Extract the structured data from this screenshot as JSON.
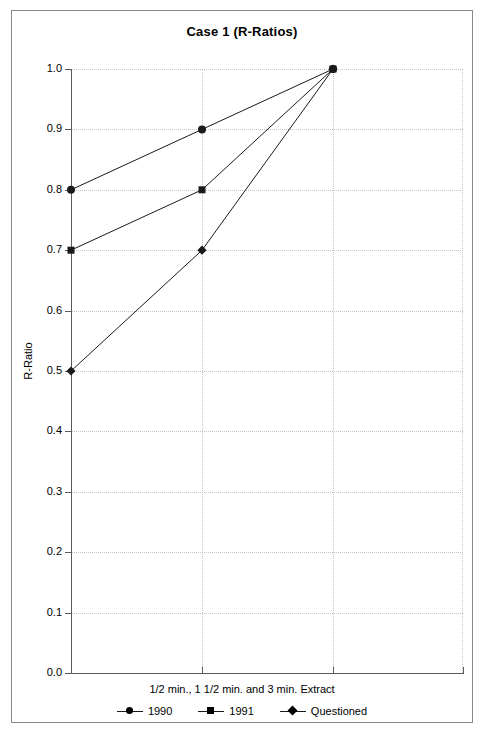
{
  "chart_data": {
    "type": "line",
    "title": "Case 1 (R-Ratios)",
    "xlabel": "1/2 min., 1 1/2 min. and 3 min. Extract",
    "ylabel": "R-Ratio",
    "categories": [
      "1/2 min.",
      "1 1/2 min.",
      "3 min."
    ],
    "series": [
      {
        "name": "1990",
        "marker": "circle",
        "values": [
          0.8,
          0.9,
          1.0
        ]
      },
      {
        "name": "1991",
        "marker": "square",
        "values": [
          0.7,
          0.8,
          1.0
        ]
      },
      {
        "name": "Questioned",
        "marker": "diamond",
        "values": [
          0.5,
          0.7,
          1.0
        ]
      }
    ],
    "ylim": [
      0.0,
      1.0
    ],
    "y_ticks": [
      "0.0",
      "0.1",
      "0.2",
      "0.3",
      "0.4",
      "0.5",
      "0.6",
      "0.7",
      "0.8",
      "0.9",
      "1.0"
    ],
    "grid": true,
    "legend_position": "bottom",
    "line_color": "#1a1a1a",
    "grid_color": "#c4c4c4",
    "axis_color": "#5a5a5a"
  },
  "legend": {
    "items": [
      {
        "label": "1990"
      },
      {
        "label": "1991"
      },
      {
        "label": "Questioned"
      }
    ]
  }
}
